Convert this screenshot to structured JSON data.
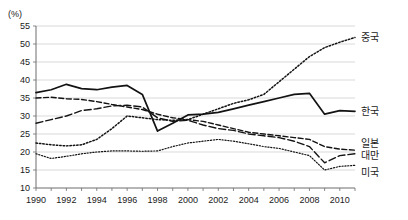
{
  "chart_data": {
    "type": "line",
    "title": "",
    "xlabel": "",
    "ylabel": "",
    "y_unit_label": "(%)",
    "xlim": [
      1990,
      2011
    ],
    "ylim": [
      10,
      55
    ],
    "y_ticks": [
      10,
      15,
      20,
      25,
      30,
      35,
      40,
      45,
      50,
      55
    ],
    "x_ticks_all": [
      1990,
      1991,
      1992,
      1993,
      1994,
      1995,
      1996,
      1997,
      1998,
      1999,
      2000,
      2001,
      2002,
      2003,
      2004,
      2005,
      2006,
      2007,
      2008,
      2009,
      2010,
      2011
    ],
    "x_tick_labels": [
      "1990",
      "1992",
      "1994",
      "1996",
      "1998",
      "2000",
      "2002",
      "2004",
      "2006",
      "2008",
      "2010"
    ],
    "x_tick_label_years": [
      1990,
      1992,
      1994,
      1996,
      1998,
      2000,
      2002,
      2004,
      2006,
      2008,
      2010
    ],
    "grid": true,
    "legend_position": "right",
    "x": [
      1990,
      1991,
      1992,
      1993,
      1994,
      1995,
      1996,
      1997,
      1998,
      1999,
      2000,
      2001,
      2002,
      2003,
      2004,
      2005,
      2006,
      2007,
      2008,
      2009,
      2010,
      2011
    ],
    "series": [
      {
        "name": "중국",
        "label": "중국",
        "style": "dotted",
        "color": "#131313",
        "values": [
          22.5,
          22.0,
          21.7,
          22.0,
          23.5,
          26.5,
          30.0,
          29.5,
          29.0,
          28.8,
          29.0,
          30.5,
          32.0,
          33.5,
          34.5,
          36.0,
          39.5,
          43.0,
          46.5,
          49.0,
          50.5,
          51.8
        ]
      },
      {
        "name": "한국",
        "label": "한국",
        "style": "solid",
        "color": "#131313",
        "values": [
          36.5,
          37.3,
          38.8,
          37.6,
          37.3,
          38.0,
          38.5,
          36.0,
          25.8,
          28.0,
          30.3,
          30.5,
          31.0,
          32.0,
          33.0,
          34.0,
          35.0,
          36.0,
          36.3,
          30.5,
          31.5,
          31.3
        ]
      },
      {
        "name": "일본",
        "label": "일본",
        "style": "dashed",
        "color": "#131313",
        "values": [
          35.0,
          35.2,
          34.8,
          34.6,
          34.0,
          33.2,
          32.5,
          31.8,
          30.5,
          29.5,
          29.0,
          28.5,
          27.5,
          26.5,
          25.5,
          25.0,
          24.5,
          24.0,
          23.5,
          21.5,
          20.8,
          20.5
        ]
      },
      {
        "name": "대만",
        "label": "대만",
        "style": "dashed-long",
        "color": "#131313",
        "values": [
          28.0,
          29.0,
          30.0,
          31.5,
          32.0,
          32.8,
          33.0,
          32.5,
          29.5,
          28.5,
          28.8,
          27.5,
          26.5,
          26.0,
          25.0,
          24.5,
          24.0,
          23.0,
          21.5,
          17.0,
          19.0,
          19.5
        ]
      },
      {
        "name": "미국",
        "label": "미국",
        "style": "dotted-fine",
        "color": "#131313",
        "values": [
          19.5,
          18.2,
          18.8,
          19.5,
          20.0,
          20.3,
          20.3,
          20.2,
          20.3,
          21.5,
          22.5,
          23.0,
          23.5,
          23.0,
          22.3,
          21.5,
          21.0,
          20.0,
          19.0,
          15.0,
          16.0,
          16.3
        ]
      }
    ]
  }
}
